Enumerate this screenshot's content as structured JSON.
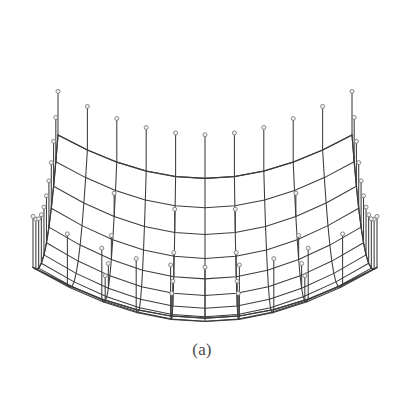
{
  "figure": {
    "caption": "(a)",
    "kind": "3d-wireframe-cable-net-dish",
    "background_color": "#ffffff",
    "line_color": "#3c3c3c",
    "node_marker_color": "#7a7a7a",
    "node_marker_fill": "#f2f2f2",
    "canvas": {
      "width": 404,
      "height": 394
    }
  },
  "chart_data": {
    "type": "line",
    "title": "(a)",
    "subtitle": "",
    "xlabel": "",
    "ylabel": "",
    "legend": [],
    "grid": false,
    "geometry": {
      "grid_cells_u": 10,
      "grid_cells_v": 10,
      "grid_nodes_u": 11,
      "grid_nodes_v": 11,
      "surface": "paraboloid",
      "sag_depth": 0.72,
      "half_span": 1.0,
      "strut_height": 0.34,
      "strut_tip_radius": 2.0,
      "strut_spacing_step": 1,
      "rim_closed": true
    },
    "projection": {
      "name": "oblique-perspective",
      "center_x": 205,
      "center_y": 196,
      "scale_x": 172,
      "scale_y": 172,
      "tilt": 0.415,
      "yaw": 0.0,
      "z_scale": 150,
      "perspective": 0.17
    },
    "extents_px": {
      "left": 33,
      "right": 378,
      "top": 88,
      "bottom": 324
    },
    "series": [
      {
        "name": "mesh-lines-u",
        "values": []
      },
      {
        "name": "mesh-lines-v",
        "values": []
      },
      {
        "name": "struts",
        "values": []
      },
      {
        "name": "strut-tips",
        "values": []
      }
    ]
  }
}
